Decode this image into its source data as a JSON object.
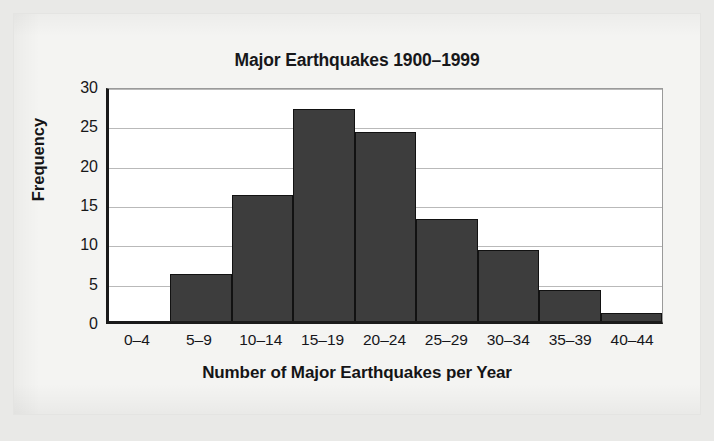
{
  "chart_data": {
    "type": "bar",
    "title": "Major Earthquakes 1900–1999",
    "xlabel": "Number of Major Earthquakes per Year",
    "ylabel": "Frequency",
    "categories": [
      "0–4",
      "5–9",
      "10–14",
      "15–19",
      "20–24",
      "25–29",
      "30–34",
      "35–39",
      "40–44"
    ],
    "values": [
      0,
      6,
      16,
      27,
      24,
      13,
      9,
      4,
      1
    ],
    "ylim": [
      0,
      30
    ],
    "yticks": [
      0,
      5,
      10,
      15,
      20,
      25,
      30
    ],
    "ytick_labels": [
      "0",
      "5",
      "10",
      "15",
      "20",
      "25",
      "30"
    ],
    "grid": true,
    "grid_axis": "y",
    "legend": null,
    "legend_position": "none",
    "bar_color": "#3d3d3d",
    "bar_edge_color": "#121212",
    "axis_color": "#1a1a1a",
    "plot_background": "#ffffff",
    "page_background": "#f4f4f2"
  }
}
